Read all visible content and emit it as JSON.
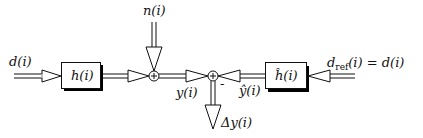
{
  "diagram": {
    "type": "block-diagram",
    "title": "",
    "blocks": [
      {
        "id": "h",
        "label": "h(i)",
        "label_main": "h",
        "label_arg": "(i)"
      },
      {
        "id": "h_hat",
        "label": "ĥ(i)",
        "label_main": "ĥ",
        "label_arg": "(i)"
      }
    ],
    "summers": [
      {
        "id": "sum1",
        "symbol": "+"
      },
      {
        "id": "sum2",
        "symbol": "+",
        "minus_input_sign": "-"
      }
    ],
    "signals": {
      "input": {
        "label": "d(i)"
      },
      "noise": {
        "label": "n(i)"
      },
      "output": {
        "label": "y(i)"
      },
      "estimate": {
        "label": "ŷ(i)"
      },
      "reference": {
        "label_main": "d",
        "label_sub": "ref",
        "label_rest": "(i) = d(i)",
        "label": "d_ref(i) = d(i)"
      },
      "error": {
        "label": "Δy(i)"
      }
    },
    "edges": [
      {
        "from": "d(i)",
        "to": "h"
      },
      {
        "from": "h",
        "to": "sum1"
      },
      {
        "from": "n(i)",
        "to": "sum1"
      },
      {
        "from": "sum1",
        "to": "sum2",
        "signal": "y(i)"
      },
      {
        "from": "d_ref(i)",
        "to": "h_hat"
      },
      {
        "from": "h_hat",
        "to": "sum2",
        "signal": "ŷ(i)",
        "sign": "-"
      },
      {
        "from": "sum2",
        "to": "Δy(i)"
      }
    ],
    "colors": {
      "stroke": "#111111",
      "fill": "#ffffff",
      "shadow": "#000000"
    }
  }
}
